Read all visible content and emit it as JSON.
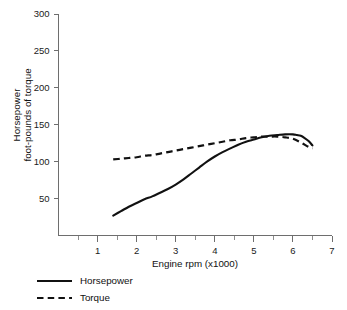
{
  "chart_data": {
    "type": "line",
    "title": "",
    "xlabel": "Engine rpm (x1000)",
    "ylabel_line1": "Horsepower",
    "ylabel_line2": "foot-pounds of torque",
    "xlim": [
      0,
      7
    ],
    "ylim": [
      0,
      300
    ],
    "x_ticks": [
      1,
      2,
      3,
      4,
      5,
      6,
      7
    ],
    "x_tick_labels": [
      "1",
      "2",
      "3",
      "4",
      "5",
      "6",
      "7"
    ],
    "x_minor_ticks": [
      0.5,
      1.5,
      2.5,
      3.5,
      4.5,
      5.5,
      6.5
    ],
    "y_ticks": [
      50,
      100,
      150,
      200,
      250,
      300
    ],
    "y_tick_labels": [
      "50",
      "100",
      "150",
      "200",
      "250",
      "300"
    ],
    "grid": false,
    "legend_position": "below-left",
    "series": [
      {
        "name": "Horsepower",
        "style": "solid",
        "color": "#111111",
        "x": [
          1.4,
          1.6,
          1.8,
          2.0,
          2.2,
          2.4,
          2.6,
          2.8,
          3.0,
          3.2,
          3.4,
          3.6,
          3.8,
          4.0,
          4.2,
          4.4,
          4.6,
          4.8,
          5.0,
          5.2,
          5.4,
          5.6,
          5.8,
          6.0,
          6.1,
          6.2,
          6.3,
          6.4,
          6.5
        ],
        "values": [
          27,
          33,
          39,
          44,
          49,
          53,
          58,
          63,
          69,
          76,
          84,
          92,
          100,
          107,
          113,
          118,
          123,
          127,
          130,
          133,
          135,
          136,
          137,
          137,
          136,
          135,
          132,
          128,
          122
        ]
      },
      {
        "name": "Torque",
        "style": "dashed",
        "color": "#111111",
        "x": [
          1.4,
          1.6,
          1.8,
          2.0,
          2.2,
          2.4,
          2.6,
          2.8,
          3.0,
          3.2,
          3.4,
          3.6,
          3.8,
          4.0,
          4.2,
          4.4,
          4.6,
          4.8,
          5.0,
          5.2,
          5.4,
          5.6,
          5.8,
          6.0,
          6.2,
          6.4,
          6.5
        ],
        "values": [
          103,
          104,
          105,
          106,
          108,
          109,
          111,
          113,
          115,
          117,
          119,
          121,
          123,
          125,
          127,
          129,
          130,
          132,
          133,
          134,
          134,
          134,
          133,
          131,
          126,
          120,
          118
        ]
      }
    ]
  },
  "legend": {
    "items": [
      {
        "label": "Horsepower",
        "style": "solid"
      },
      {
        "label": "Torque",
        "style": "dashed"
      }
    ]
  }
}
